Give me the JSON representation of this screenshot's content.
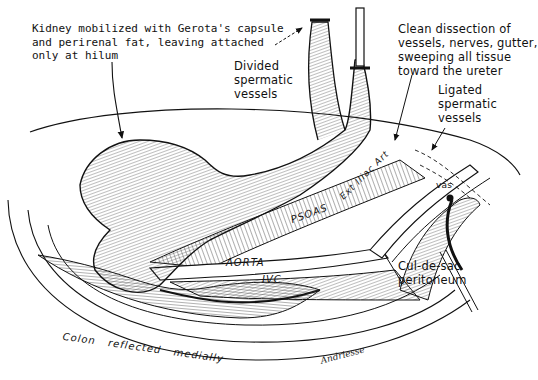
{
  "figure": {
    "labels": {
      "kidney_note": "Kidney mobilized with Gerota's capsule\nand perirenal fat, leaving attached\nonly at hilum",
      "divided_vessels": "Divided\nspermatic\nvessels",
      "clean_dissection": "Clean dissection of\nvessels, nerves, gutter,\nsweeping all tissue\ntoward the ureter",
      "ligated_vessels": "Ligated\nspermatic\nvessels",
      "vas": "vas",
      "psoas": "PSOAS",
      "ext_iliac": "Ext Iliac Art",
      "aorta": "AORTA",
      "ivc": "IVC",
      "cul_de_sac": "Cul-de-sac\nperitoneum",
      "colon": "Colon   reflected   medially",
      "signature": "Andriesse"
    }
  }
}
